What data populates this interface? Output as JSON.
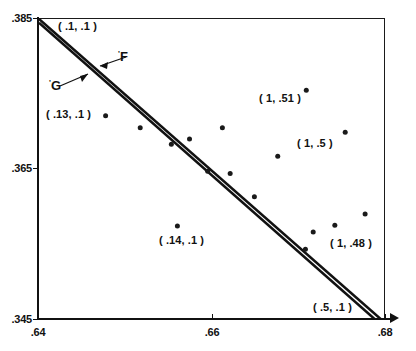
{
  "chart_data": {
    "type": "scatter",
    "title": "",
    "xlabel": "",
    "ylabel": "",
    "xlim": [
      0.64,
      0.68
    ],
    "ylim": [
      0.345,
      0.385
    ],
    "grid": false,
    "legend": "none",
    "x_ticks": [
      {
        "value": 0.64,
        "label": ".64"
      },
      {
        "value": 0.66,
        "label": ".66"
      },
      {
        "value": 0.68,
        "label": ".68"
      }
    ],
    "y_ticks": [
      {
        "value": 0.345,
        "label": ".345"
      },
      {
        "value": 0.365,
        "label": ".365"
      },
      {
        "value": 0.385,
        "label": ".385"
      }
    ],
    "series": [
      {
        "name": "data points",
        "type": "scatter",
        "x": [
          0.6477,
          0.6517,
          0.6553,
          0.6574,
          0.6612,
          0.6595,
          0.6621,
          0.6709,
          0.6754,
          0.6676,
          0.6649,
          0.6717,
          0.6742,
          0.6777,
          0.656,
          0.6708
        ],
        "y": [
          0.3721,
          0.3705,
          0.3683,
          0.369,
          0.3705,
          0.3647,
          0.3644,
          0.3755,
          0.3699,
          0.3667,
          0.3613,
          0.3566,
          0.3575,
          0.359,
          0.3574,
          0.3543
        ]
      },
      {
        "name": "F'",
        "type": "line",
        "label": "F",
        "prime": "'",
        "x": [
          0.64,
          0.6795
        ],
        "y": [
          0.385,
          0.345
        ],
        "note": "upper of the two near-parallel descending lines"
      },
      {
        "name": "G'",
        "type": "line",
        "label": "G",
        "prime": "'",
        "x": [
          0.64,
          0.6788
        ],
        "y": [
          0.3845,
          0.345
        ],
        "note": "lower of the two near-parallel descending lines"
      }
    ],
    "annotations": [
      {
        "id": "ann-01-01",
        "text": "( .1, .1 )",
        "x": 0.6468,
        "y": 0.382
      },
      {
        "id": "ann-013-01",
        "text": "( .13, .1 )",
        "x": 0.648,
        "y": 0.3695
      },
      {
        "id": "ann-014-01",
        "text": "( .14, .1 )",
        "x": 0.6615,
        "y": 0.3572
      },
      {
        "id": "ann-05-01",
        "text": "( .5, .1 )",
        "x": 0.674,
        "y": 0.3477
      },
      {
        "id": "ann-1-051",
        "text": "( 1, .51 )",
        "x": 0.6672,
        "y": 0.3718
      },
      {
        "id": "ann-1-05",
        "text": "( 1, .5 )",
        "x": 0.671,
        "y": 0.3659
      },
      {
        "id": "ann-1-048",
        "text": "( 1, .48 )",
        "x": 0.6755,
        "y": 0.3578
      }
    ]
  },
  "axes": {
    "y_label_top": ".385",
    "y_label_mid": ".365",
    "y_label_bottom": ".345",
    "x_label_left": ".64",
    "x_label_mid": ".66",
    "x_label_right": ".68"
  },
  "labels": {
    "curve_f": "F",
    "curve_g": "G",
    "prime": "'",
    "p_01_01": "( .1, .1 )",
    "p_013_01": "( .13, .1 )",
    "p_014_01": "( .14, .1 )",
    "p_05_01": "( .5, .1 )",
    "p_1_051": "( 1, .51 )",
    "p_1_05": "( 1, .5 )",
    "p_1_048": "( 1, .48 )"
  },
  "colors": {
    "ink": "#111111",
    "background": "#ffffff",
    "point": "#1a1a1a"
  }
}
